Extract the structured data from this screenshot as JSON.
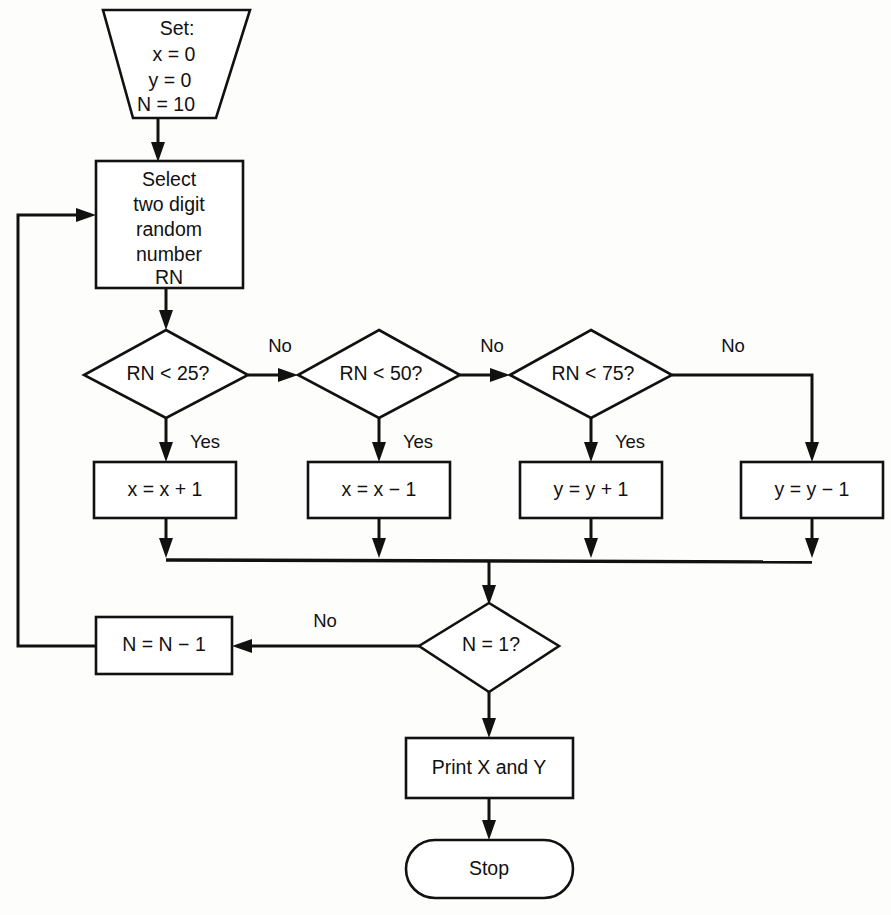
{
  "diagram": {
    "type": "flowchart",
    "colors": {
      "background": "#fdfdfc",
      "stroke": "#111111",
      "fill": "#ffffff"
    },
    "nodes": {
      "init": {
        "shape": "trapezoid",
        "name": "initialization",
        "lines": [
          "Set:",
          "x = 0",
          "y = 0",
          "N = 10"
        ]
      },
      "select": {
        "shape": "rectangle",
        "name": "select-random-number",
        "lines": [
          "Select",
          "two digit",
          "random",
          "number",
          "RN"
        ]
      },
      "d1": {
        "shape": "diamond",
        "name": "decision-rn-lt-25",
        "label": "RN < 25?"
      },
      "d2": {
        "shape": "diamond",
        "name": "decision-rn-lt-50",
        "label": "RN < 50?"
      },
      "d3": {
        "shape": "diamond",
        "name": "decision-rn-lt-75",
        "label": "RN < 75?"
      },
      "a1": {
        "shape": "rectangle",
        "name": "action-x-increment",
        "label": "x = x + 1"
      },
      "a2": {
        "shape": "rectangle",
        "name": "action-x-decrement",
        "label": "x = x − 1"
      },
      "a3": {
        "shape": "rectangle",
        "name": "action-y-increment",
        "label": "y = y + 1"
      },
      "a4": {
        "shape": "rectangle",
        "name": "action-y-decrement",
        "label": "y = y − 1"
      },
      "d4": {
        "shape": "diamond",
        "name": "decision-n-equals-1",
        "label": "N = 1?"
      },
      "dec_n": {
        "shape": "rectangle",
        "name": "action-n-decrement",
        "label": "N = N − 1"
      },
      "print": {
        "shape": "rectangle",
        "name": "print-results",
        "label": "Print X and Y"
      },
      "stop": {
        "shape": "terminator",
        "name": "stop-terminator",
        "label": "Stop"
      }
    },
    "branch_labels": {
      "d1_no": "No",
      "d1_yes": "Yes",
      "d2_no": "No",
      "d2_yes": "Yes",
      "d3_no": "No",
      "d3_yes": "Yes",
      "d3_else_no": "No",
      "d4_no": "No"
    },
    "edges": [
      {
        "from": "init",
        "to": "select",
        "label": ""
      },
      {
        "from": "select",
        "to": "d1",
        "label": ""
      },
      {
        "from": "d1",
        "to": "d2",
        "label": "No"
      },
      {
        "from": "d1",
        "to": "a1",
        "label": "Yes"
      },
      {
        "from": "d2",
        "to": "d3",
        "label": "No"
      },
      {
        "from": "d2",
        "to": "a2",
        "label": "Yes"
      },
      {
        "from": "d3",
        "to": "a4",
        "label": "No"
      },
      {
        "from": "d3",
        "to": "a3",
        "label": "Yes"
      },
      {
        "from": "a1",
        "to": "d4",
        "label": ""
      },
      {
        "from": "a2",
        "to": "d4",
        "label": ""
      },
      {
        "from": "a3",
        "to": "d4",
        "label": ""
      },
      {
        "from": "a4",
        "to": "d4",
        "label": ""
      },
      {
        "from": "d4",
        "to": "dec_n",
        "label": "No"
      },
      {
        "from": "dec_n",
        "to": "select",
        "label": ""
      },
      {
        "from": "d4",
        "to": "print",
        "label": ""
      },
      {
        "from": "print",
        "to": "stop",
        "label": ""
      }
    ]
  }
}
